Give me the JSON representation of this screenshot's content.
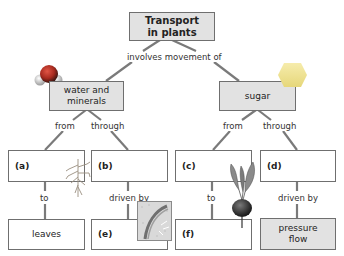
{
  "diagram": {
    "title": "Transport\nin plants",
    "title_line1": "Transport",
    "title_line2": "in plants",
    "root_link": "involves movement of",
    "branches": [
      {
        "label_line1": "water and",
        "label_line2": "minerals",
        "icon": "water-molecule-icon",
        "links": {
          "left": "from",
          "right": "through"
        },
        "children": [
          {
            "id": "(a)",
            "link_down": "to",
            "target": "leaves",
            "image": "root-illustration"
          },
          {
            "id": "(b)",
            "link_down": "driven by",
            "target": "(e)",
            "image": "leaf-cross-section-illustration"
          }
        ]
      },
      {
        "label": "sugar",
        "icon": "sugar-hexagon-icon",
        "links": {
          "left": "from",
          "right": "through"
        },
        "children": [
          {
            "id": "(c)",
            "link_down": "to",
            "target": "(f)",
            "image": "beetroot-illustration"
          },
          {
            "id": "(d)",
            "link_down": "driven by",
            "target_line1": "pressure",
            "target_line2": "flow"
          }
        ]
      }
    ]
  },
  "colors": {
    "box_border": "#6f6f6f",
    "box_grey_fill": "#e2e2e2",
    "connector": "#777777",
    "hexagon": "#f0e48e",
    "molecule_red": "#c0392b",
    "molecule_white": "#eeeeee"
  }
}
